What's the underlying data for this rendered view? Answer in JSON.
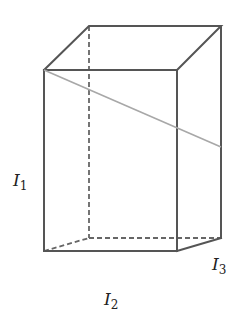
{
  "diagram": {
    "type": "rectangular-prism",
    "colors": {
      "edge": "#555555",
      "hidden_edge": "#666666",
      "diagonal": "#a8a8a8",
      "background": "#ffffff"
    },
    "vertices": {
      "front_top_left": [
        44,
        70
      ],
      "front_top_right": [
        177,
        70
      ],
      "back_top_left": [
        89,
        26
      ],
      "back_top_right": [
        221,
        26
      ],
      "front_bottom_left": [
        44,
        251
      ],
      "front_bottom_right": [
        177,
        251
      ],
      "back_bottom_left": [
        90,
        238
      ],
      "back_bottom_right": [
        221,
        238
      ]
    },
    "labels": {
      "height": {
        "letter": "I",
        "sub": "1"
      },
      "width": {
        "letter": "I",
        "sub": "2"
      },
      "depth": {
        "letter": "I",
        "sub": "3"
      }
    }
  }
}
